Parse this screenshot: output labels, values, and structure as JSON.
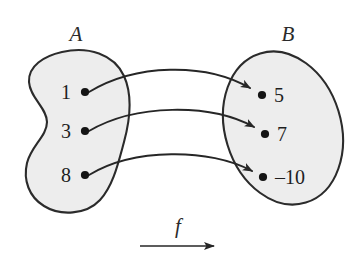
{
  "figure": {
    "kind": "function-mapping-diagram",
    "background_color": "#ffffff",
    "outline_color": "#2b2b2b",
    "fill_color": "#ededed",
    "text_color": "#1e1e1e",
    "domain_set": {
      "label": "A",
      "shape": "bean",
      "elements": [
        {
          "label": "1",
          "x": 70,
          "y": 92
        },
        {
          "label": "3",
          "x": 70,
          "y": 131
        },
        {
          "label": "8",
          "x": 70,
          "y": 175
        }
      ]
    },
    "codomain_set": {
      "label": "B",
      "shape": "ellipse",
      "elements": [
        {
          "label": "5",
          "x": 272,
          "y": 95
        },
        {
          "label": "7",
          "x": 272,
          "y": 134
        },
        {
          "label": "–10",
          "x": 272,
          "y": 177
        }
      ]
    },
    "mappings": [
      {
        "from": "1",
        "to": "5"
      },
      {
        "from": "3",
        "to": "7"
      },
      {
        "from": "8",
        "to": "–10"
      }
    ],
    "function_name": "f",
    "function_arrow": {
      "from_x": 140,
      "to_x": 216,
      "y": 246
    }
  }
}
